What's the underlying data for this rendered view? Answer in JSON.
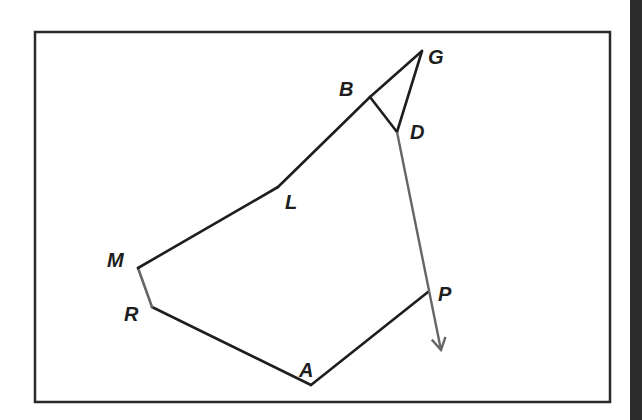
{
  "diagram": {
    "frame": {
      "x": 35,
      "y": 32,
      "width": 575,
      "height": 370
    },
    "colors": {
      "line": "#1e1e1e",
      "gray_line": "#666666",
      "frame": "#2a2a2a",
      "edge_strip": "#2b2b2b",
      "background": "#ffffff"
    },
    "points": {
      "G": {
        "label": "G",
        "x": 422,
        "y": 51,
        "label_x": 428,
        "label_y": 64
      },
      "B": {
        "label": "B",
        "x": 370,
        "y": 97,
        "label_x": 339,
        "label_y": 96
      },
      "D": {
        "label": "D",
        "x": 397,
        "y": 132,
        "label_x": 410,
        "label_y": 139
      },
      "L": {
        "label": "L",
        "x": 278,
        "y": 187,
        "label_x": 285,
        "label_y": 209
      },
      "M": {
        "label": "M",
        "x": 138,
        "y": 268,
        "label_x": 107,
        "label_y": 267
      },
      "R": {
        "label": "R",
        "x": 152,
        "y": 307,
        "label_x": 124,
        "label_y": 321
      },
      "A": {
        "label": "A",
        "x": 311,
        "y": 385,
        "label_x": 299,
        "label_y": 377
      },
      "P": {
        "label": "P",
        "x": 428,
        "y": 292,
        "label_x": 438,
        "label_y": 301
      }
    },
    "segments": [
      {
        "from": "A",
        "to": "R",
        "style": "black"
      },
      {
        "from": "R",
        "to": "M",
        "style": "gray"
      },
      {
        "from": "M",
        "to": "L",
        "style": "black"
      },
      {
        "from": "L",
        "to": "B",
        "style": "black"
      },
      {
        "from": "B",
        "to": "G",
        "style": "black"
      },
      {
        "from": "G",
        "to": "D",
        "style": "black"
      },
      {
        "from": "B",
        "to": "D",
        "style": "black"
      },
      {
        "from": "A",
        "to": "P",
        "style": "black"
      }
    ],
    "arrow": {
      "from": "D",
      "through": "P",
      "tip_x": 441,
      "tip_y": 350,
      "style": "gray"
    }
  }
}
